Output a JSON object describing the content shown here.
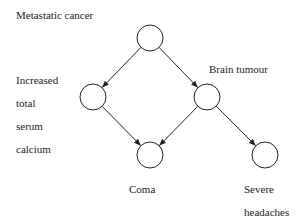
{
  "diagram": {
    "type": "bayesian-network",
    "nodes": [
      {
        "id": "metastatic",
        "label": "Metastatic cancer",
        "x": 150,
        "y": 38
      },
      {
        "id": "calcium",
        "label_lines": [
          "Increased",
          "total",
          "serum",
          "calcium"
        ],
        "x": 93,
        "y": 97
      },
      {
        "id": "tumour",
        "label": "Brain tumour",
        "x": 207,
        "y": 97
      },
      {
        "id": "coma",
        "label": "Coma",
        "x": 150,
        "y": 155
      },
      {
        "id": "headaches",
        "label_lines": [
          "Severe",
          "headaches"
        ],
        "x": 265,
        "y": 155
      }
    ],
    "edges": [
      {
        "from": "metastatic",
        "to": "calcium"
      },
      {
        "from": "metastatic",
        "to": "tumour"
      },
      {
        "from": "calcium",
        "to": "coma"
      },
      {
        "from": "tumour",
        "to": "coma"
      },
      {
        "from": "tumour",
        "to": "headaches"
      }
    ]
  }
}
